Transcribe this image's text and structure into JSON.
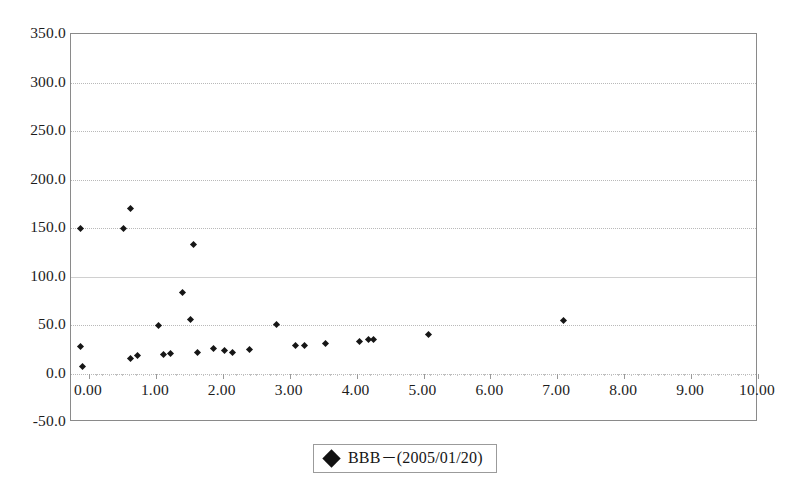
{
  "chart_data": {
    "type": "scatter",
    "title": "",
    "xlabel": "",
    "ylabel": "",
    "xlim": [
      0.0,
      10.0
    ],
    "ylim": [
      -50.0,
      350.0
    ],
    "xticks": [
      "0.00",
      "1.00",
      "2.00",
      "3.00",
      "4.00",
      "5.00",
      "6.00",
      "7.00",
      "8.00",
      "9.00",
      "10.00"
    ],
    "xtick_values": [
      0,
      1,
      2,
      3,
      4,
      5,
      6,
      7,
      8,
      9,
      10
    ],
    "yticks": [
      "350.0",
      "300.0",
      "250.0",
      "200.0",
      "150.0",
      "100.0",
      "50.0",
      "0.0",
      "-50.0"
    ],
    "ytick_values": [
      350,
      300,
      250,
      200,
      150,
      100,
      50,
      0,
      -50
    ],
    "grid": true,
    "grid_axis": "y",
    "legend_position": "bottom-center",
    "series": [
      {
        "name": "BBB－(2005/01/20)",
        "marker": "diamond",
        "color": "#161616",
        "points": [
          [
            -0.12,
            150.0
          ],
          [
            -0.12,
            28.0
          ],
          [
            -0.1,
            7.0
          ],
          [
            0.52,
            150.0
          ],
          [
            0.62,
            170.0
          ],
          [
            0.62,
            15.0
          ],
          [
            0.72,
            19.0
          ],
          [
            1.04,
            50.0
          ],
          [
            1.12,
            20.0
          ],
          [
            1.22,
            21.0
          ],
          [
            1.4,
            84.0
          ],
          [
            1.52,
            56.0
          ],
          [
            1.56,
            133.0
          ],
          [
            1.62,
            22.0
          ],
          [
            1.86,
            26.0
          ],
          [
            2.02,
            24.0
          ],
          [
            2.14,
            22.0
          ],
          [
            2.4,
            25.0
          ],
          [
            2.8,
            51.0
          ],
          [
            3.08,
            29.0
          ],
          [
            3.22,
            29.0
          ],
          [
            3.54,
            31.0
          ],
          [
            4.04,
            33.0
          ],
          [
            4.18,
            35.0
          ],
          [
            4.26,
            35.0
          ],
          [
            5.08,
            40.0
          ],
          [
            7.1,
            55.0
          ]
        ]
      }
    ]
  },
  "legend": {
    "marker_name": "diamond-marker",
    "label": "BBB－(2005/01/20)"
  },
  "colors": {
    "marker": "#161616",
    "grid": "#b9b9b9",
    "axis": "#8a8a8a",
    "text": "#1c1c1c",
    "background": "#ffffff"
  }
}
